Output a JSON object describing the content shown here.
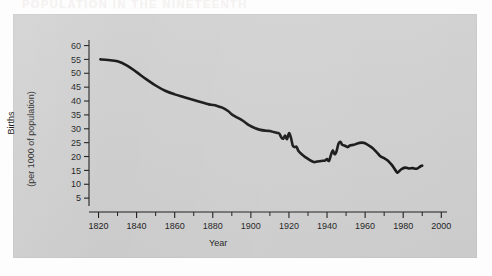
{
  "page": {
    "background_color": "#fdfdfd",
    "panel_color": "#cfcfcf",
    "bleed_text": "POPULATION IN THE NINETEENTH"
  },
  "chart_data": {
    "type": "line",
    "title": "",
    "subtitle": "",
    "xlabel": "Year",
    "ylabel": "Births\n(per 1000 of population)",
    "ylabel_line1": "Births",
    "ylabel_line2": "(per 1000 of population)",
    "xlim": [
      1815,
      2003
    ],
    "ylim": [
      0,
      62
    ],
    "x_major_ticks": [
      1820,
      1840,
      1860,
      1880,
      1900,
      1920,
      1940,
      1960,
      1980,
      2000
    ],
    "x_minor_ticks": [
      1830,
      1850,
      1870,
      1890,
      1910,
      1930,
      1950,
      1970,
      1990
    ],
    "x_tick_labels": [
      "1820",
      "1840",
      "1860",
      "1880",
      "1900",
      "1920",
      "1940",
      "1960",
      "1980",
      "2000"
    ],
    "y_ticks": [
      5,
      10,
      15,
      20,
      25,
      30,
      35,
      40,
      45,
      50,
      55,
      60
    ],
    "y_tick_labels": [
      "5",
      "10",
      "15",
      "20",
      "25",
      "30",
      "35",
      "40",
      "45",
      "50",
      "55",
      "60"
    ],
    "grid": false,
    "legend": "none",
    "line_color": "#111111",
    "line_width": 2.6,
    "series": [
      {
        "name": "Birth rate (per 1000 of population)",
        "x": [
          1821,
          1825,
          1830,
          1835,
          1840,
          1845,
          1850,
          1855,
          1860,
          1865,
          1870,
          1875,
          1878,
          1880,
          1882,
          1885,
          1888,
          1890,
          1893,
          1896,
          1899,
          1902,
          1905,
          1908,
          1910,
          1912,
          1914,
          1915,
          1916,
          1917,
          1918,
          1919,
          1920,
          1921,
          1922,
          1923,
          1924,
          1925,
          1927,
          1929,
          1931,
          1933,
          1935,
          1937,
          1939,
          1940,
          1941,
          1942,
          1943,
          1944,
          1945,
          1946,
          1947,
          1948,
          1949,
          1950,
          1951,
          1952,
          1954,
          1956,
          1958,
          1960,
          1962,
          1964,
          1966,
          1968,
          1970,
          1972,
          1974,
          1976,
          1977,
          1979,
          1981,
          1983,
          1985,
          1987,
          1989,
          1990
        ],
        "y": [
          55.0,
          54.8,
          54.3,
          52.8,
          50.4,
          47.9,
          45.6,
          43.7,
          42.4,
          41.4,
          40.4,
          39.4,
          38.8,
          38.6,
          38.3,
          37.6,
          36.4,
          35.2,
          34.0,
          32.8,
          31.3,
          30.3,
          29.6,
          29.3,
          29.2,
          28.8,
          28.5,
          28.2,
          26.9,
          26.4,
          27.6,
          26.3,
          28.4,
          26.9,
          24.0,
          23.4,
          23.5,
          22.0,
          20.6,
          19.6,
          18.7,
          18.0,
          18.2,
          18.4,
          18.6,
          19.1,
          18.4,
          20.4,
          22.2,
          20.8,
          21.9,
          24.6,
          25.3,
          24.2,
          24.0,
          23.7,
          23.4,
          24.0,
          24.2,
          24.7,
          25.0,
          24.8,
          23.9,
          23.0,
          21.6,
          20.1,
          19.4,
          18.5,
          17.0,
          15.0,
          14.2,
          15.4,
          16.0,
          15.7,
          15.8,
          15.6,
          16.4,
          16.7
        ]
      }
    ]
  }
}
